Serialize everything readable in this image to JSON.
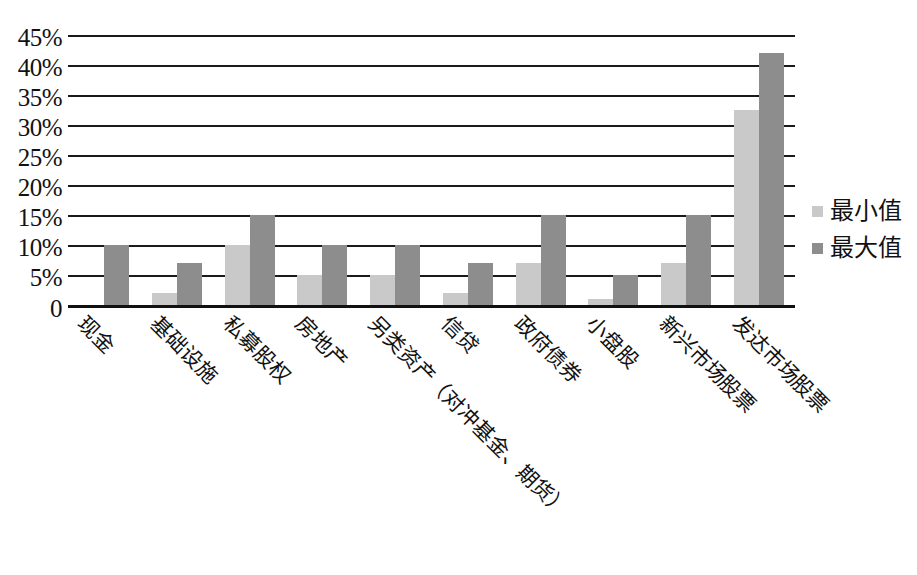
{
  "chart_data": {
    "type": "bar",
    "title": "",
    "subtitle": "",
    "xlabel": "",
    "ylabel": "",
    "ylim": [
      0,
      45
    ],
    "ytick_values": [
      45,
      40,
      35,
      30,
      25,
      20,
      15,
      10,
      5,
      0
    ],
    "ytick_labels": [
      "45%",
      "40%",
      "35%",
      "30%",
      "25%",
      "20%",
      "15%",
      "10%",
      "5%",
      "0"
    ],
    "grid": true,
    "legend_position": "right",
    "categories": [
      "现金",
      "基础设施",
      "私募股权",
      "房地产",
      "另类资产（对冲基金、期货）",
      "信贷",
      "政府债券",
      "小盘股",
      "新兴市场股票",
      "发达市场股票"
    ],
    "series": [
      {
        "name": "最小值",
        "color": "#c9c9c9",
        "values": [
          0,
          2,
          10,
          5,
          5,
          2,
          7,
          1,
          7,
          32.5
        ]
      },
      {
        "name": "最大值",
        "color": "#8d8d8d",
        "values": [
          10,
          7,
          15,
          10,
          10,
          7,
          15,
          5,
          15,
          42
        ]
      }
    ]
  },
  "legend": {
    "items": [
      {
        "label": "最小值",
        "swatch": "min"
      },
      {
        "label": "最大值",
        "swatch": "max"
      }
    ]
  },
  "colors": {
    "min_series": "#c9c9c9",
    "max_series": "#8d8d8d",
    "axis": "#111111",
    "background": "#ffffff"
  }
}
